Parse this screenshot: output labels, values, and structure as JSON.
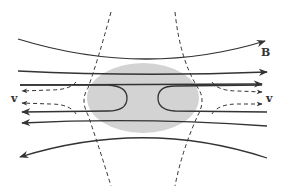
{
  "diagram": {
    "labels": {
      "field": "B",
      "velocity_left": "v",
      "velocity_right": "v"
    },
    "colors": {
      "line": "#333333",
      "shaded_region": "#d3d3d3",
      "background": "#ffffff"
    },
    "elements": {
      "field_lines": 6,
      "separatrices": 2,
      "flow_arrows": 4,
      "shaded_region": "ellipse"
    }
  }
}
